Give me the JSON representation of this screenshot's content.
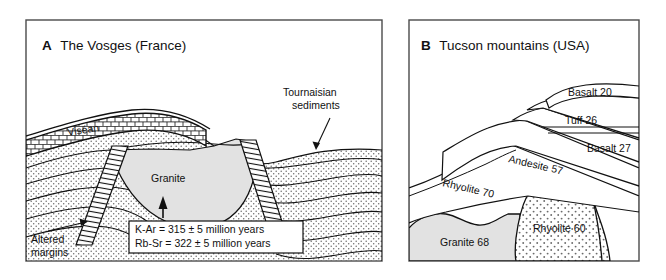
{
  "figure": {
    "panels": [
      {
        "key": "A",
        "letter": "A",
        "title": "The Vosges (France)",
        "labels": {
          "visean": "Viséan",
          "granite": "Granite",
          "tournaisian_line1": "Tournaisian",
          "tournaisian_line2": "sediments",
          "altered_line1": "Altered",
          "altered_line2": "margins"
        },
        "age_box": {
          "line1": "K-Ar  =  315  ±  5 million years",
          "line2": "Rb-Sr  =  322  ±  5 million years",
          "methods": [
            "K-Ar",
            "Rb-Sr"
          ],
          "ages": [
            315,
            322
          ],
          "uncertainties": [
            5,
            5
          ],
          "units": "million years"
        }
      },
      {
        "key": "B",
        "letter": "B",
        "title": "Tucson mountains (USA)",
        "labels": {
          "basalt20": "Basalt 20",
          "tuff26": "Tuff 26",
          "basalt27": "Basalt 27",
          "andesite57": "Andesite 57",
          "rhyolite70": "Rhyolite 70",
          "rhyolite60": "Rhyolite 60",
          "granite68": "Granite 68"
        },
        "units": [
          {
            "name": "Basalt",
            "age_ma": 20
          },
          {
            "name": "Tuff",
            "age_ma": 26
          },
          {
            "name": "Basalt",
            "age_ma": 27
          },
          {
            "name": "Andesite",
            "age_ma": 57
          },
          {
            "name": "Rhyolite",
            "age_ma": 70
          },
          {
            "name": "Rhyolite",
            "age_ma": 60
          },
          {
            "name": "Granite",
            "age_ma": 68
          }
        ]
      }
    ],
    "colors": {
      "stroke": "#111111",
      "granite_fill": "#e2e2e2",
      "sediment_stipple": "#6b6b6b",
      "rhyolite_stipple": "#6b6b6b",
      "background": "#ffffff",
      "frame": "#4a4a4a"
    }
  }
}
